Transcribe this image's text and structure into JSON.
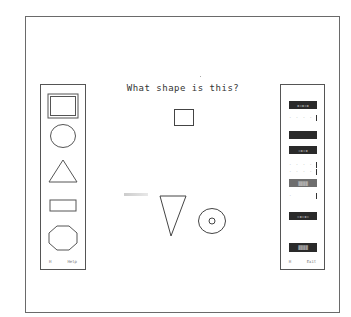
{
  "question": {
    "title": "What shape is this?",
    "target_shape": "square"
  },
  "left_panel": {
    "shapes": [
      {
        "name": "square",
        "selected": true
      },
      {
        "name": "circle",
        "selected": false
      },
      {
        "name": "triangle",
        "selected": false
      },
      {
        "name": "rectangle",
        "selected": false
      },
      {
        "name": "octagon",
        "selected": false
      }
    ],
    "footer_left": "H",
    "footer_right": "Help"
  },
  "right_panel": {
    "buttons": [
      {
        "label": "",
        "style": "dark"
      },
      {
        "label": "",
        "style": "dots"
      },
      {
        "label": "",
        "style": "dark"
      },
      {
        "label": "",
        "style": "dark"
      },
      {
        "label": "",
        "style": "dots"
      },
      {
        "label": "",
        "style": "dots"
      },
      {
        "label": "",
        "style": "gray"
      },
      {
        "label": "",
        "style": "dots"
      },
      {
        "label": "",
        "style": "dark"
      },
      {
        "label": "",
        "style": "dark"
      }
    ],
    "footer_left": "H",
    "footer_right": "Exit"
  },
  "distractor_shapes": [
    "inverted-triangle",
    "ring"
  ],
  "colors": {
    "background": "#ffffff",
    "stroke": "#444444",
    "button_dark": "#2a2a2a"
  }
}
